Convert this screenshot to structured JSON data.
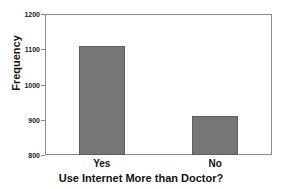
{
  "chart_data": {
    "type": "bar",
    "title": "",
    "xlabel": "Use Internet More than Doctor?",
    "ylabel": "Frequency",
    "categories": [
      "Yes",
      "No"
    ],
    "values": [
      1110,
      910
    ],
    "ylim": [
      800,
      1200
    ],
    "yticks": [
      800,
      900,
      1000,
      1100,
      1200
    ],
    "ytick_labels": [
      "800",
      "900",
      "1000",
      "1100",
      "1200"
    ],
    "grid": false,
    "legend": false,
    "bar_color": "#767676",
    "bar_edge_color": "#5e5e5e",
    "frame_color": "#8d8d8d",
    "background": "#ffffff"
  }
}
